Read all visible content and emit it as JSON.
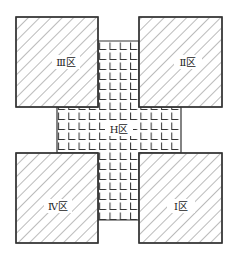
{
  "diagram": {
    "title": "",
    "zones": [
      {
        "id": "III",
        "label": "Ⅲ区",
        "position": "top-left",
        "pattern": "diagonal-hatch"
      },
      {
        "id": "II",
        "label": "Ⅱ区",
        "position": "top-right",
        "pattern": "diagonal-hatch"
      },
      {
        "id": "IV",
        "label": "Ⅳ区",
        "position": "bottom-left",
        "pattern": "diagonal-hatch"
      },
      {
        "id": "I",
        "label": "Ⅰ区",
        "position": "bottom-right",
        "pattern": "diagonal-hatch"
      },
      {
        "id": "H",
        "label": "H区",
        "position": "center-cross",
        "pattern": "grid"
      }
    ],
    "colors": {
      "stroke": "#333333",
      "background": "#ffffff"
    }
  }
}
